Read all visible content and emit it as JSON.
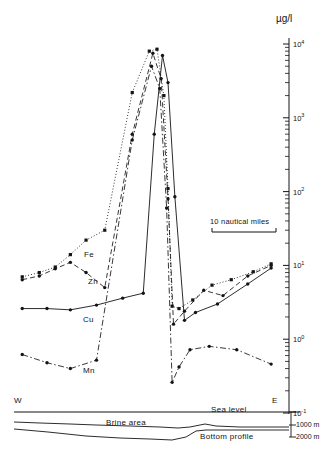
{
  "figure": {
    "unit_label": "µg/l",
    "west_label": "W",
    "east_label": "E",
    "sea_level_label": "Sea level",
    "brine_area_label": "Brine area",
    "bottom_profile_label": "Bottom profile",
    "scale_bar_label": "10 nautical miles",
    "depth_1000": "1000 m",
    "depth_2000": "2000 m",
    "series_labels": {
      "fe": "Fe",
      "zn": "Zn",
      "cu": "Cu",
      "mn": "Mn"
    }
  },
  "axis": {
    "tick_labels": [
      "10⁴",
      "10³",
      "10²",
      "10¹",
      "10⁰",
      "10⁻¹"
    ],
    "exponents": [
      "4",
      "3",
      "2",
      "1",
      "0",
      "-1"
    ],
    "label_base": "10"
  },
  "chart_data": {
    "type": "line",
    "title": "",
    "xlabel": "West – East transect across brine area",
    "ylabel": "µg/l",
    "ylim": [
      0.1,
      10000
    ],
    "yscale": "log",
    "ytick_values": [
      10000,
      1000,
      100,
      10,
      1,
      0.1
    ],
    "ytick_labels": [
      "10⁴",
      "10³",
      "10²",
      "10¹",
      "10⁰",
      "10⁻¹"
    ],
    "grid": false,
    "legend": "inline-annotations",
    "annotations": [
      {
        "text": "Fe",
        "x": 0.21,
        "y": 22
      },
      {
        "text": "Zn",
        "x": 0.26,
        "y": 11
      },
      {
        "text": "Cu",
        "x": 0.29,
        "y": 2.6
      },
      {
        "text": "Mn",
        "x": 0.33,
        "y": 0.5
      },
      {
        "text": "10 nautical miles",
        "x": 0.76,
        "y": 80
      },
      {
        "text": "Sea level",
        "x": 0.79,
        "y": 0.135
      },
      {
        "text": "Brine area",
        "x": 0.44,
        "y": 0.11
      },
      {
        "text": "Bottom profile",
        "x": 0.79,
        "y": 0.095
      },
      {
        "text": "W",
        "x": 0.03,
        "y": 0.16
      },
      {
        "text": "E",
        "x": 0.93,
        "y": 0.16
      }
    ],
    "series": [
      {
        "name": "Fe",
        "style": "dotted",
        "marker": "square",
        "x": [
          0.03,
          0.092,
          0.15,
          0.205,
          0.262,
          0.33,
          0.43,
          0.492,
          0.52,
          0.545,
          0.56,
          0.575,
          0.6,
          0.65,
          0.72,
          0.79,
          0.87,
          0.935
        ],
        "values": [
          7.0,
          8.0,
          9.5,
          14.0,
          22.0,
          30.0,
          2200,
          8000,
          8500,
          2000,
          110,
          2.8,
          2.6,
          3.4,
          5.4,
          6.4,
          8.2,
          10.5
        ]
      },
      {
        "name": "Zn",
        "style": "dashed",
        "marker": "circle",
        "x": [
          0.03,
          0.092,
          0.15,
          0.205,
          0.262,
          0.33,
          0.43,
          0.505,
          0.535,
          0.56,
          0.58,
          0.62,
          0.69,
          0.76,
          0.85,
          0.935
        ],
        "values": [
          6.4,
          7.2,
          9.0,
          11.0,
          8.0,
          5.0,
          600,
          7500,
          3400,
          80,
          1.6,
          2.4,
          4.6,
          3.9,
          7.2,
          10.0
        ]
      },
      {
        "name": "Cu",
        "style": "solid",
        "marker": "circle",
        "x": [
          0.03,
          0.12,
          0.205,
          0.3,
          0.395,
          0.47,
          0.51,
          0.54,
          0.56,
          0.585,
          0.62,
          0.66,
          0.74,
          0.85,
          0.935
        ],
        "values": [
          2.6,
          2.6,
          2.5,
          2.9,
          3.6,
          4.2,
          600,
          7000,
          3000,
          85,
          1.8,
          2.3,
          3.0,
          5.6,
          9.2
        ]
      },
      {
        "name": "Mn",
        "style": "dash-dot",
        "marker": "circle",
        "x": [
          0.03,
          0.12,
          0.205,
          0.3,
          0.43,
          0.5,
          0.53,
          0.555,
          0.575,
          0.6,
          0.64,
          0.71,
          0.81,
          0.935
        ],
        "values": [
          0.62,
          0.48,
          0.4,
          0.52,
          500,
          5000,
          2500,
          60,
          0.26,
          0.42,
          0.72,
          0.8,
          0.72,
          0.46
        ]
      }
    ]
  }
}
